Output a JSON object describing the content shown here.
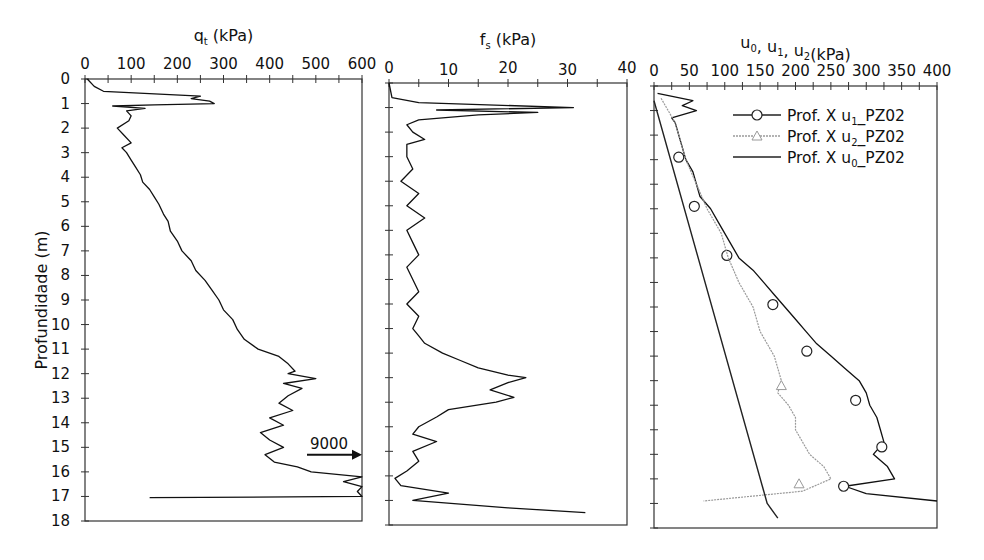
{
  "chart_data": [
    {
      "type": "line",
      "title": "qt (kPa)",
      "title_main": "q",
      "title_sub": "t",
      "title_rest": " (kPa)",
      "xlabel": "qt (kPa)",
      "ylabel": "Profundidade (m)",
      "xlim": [
        0,
        600
      ],
      "ylim": [
        18,
        0
      ],
      "x_ticks": [
        0,
        100,
        200,
        300,
        400,
        500,
        600
      ],
      "y_ticks": [
        0,
        1,
        2,
        3,
        4,
        5,
        6,
        7,
        8,
        9,
        10,
        11,
        12,
        13,
        14,
        15,
        16,
        17,
        18
      ],
      "annotation": {
        "text": "9000",
        "x": 520,
        "depth": 15.3,
        "arrow": "right"
      },
      "series": [
        {
          "name": "qt",
          "depth": [
            0,
            0.3,
            0.5,
            0.7,
            0.8,
            0.9,
            1.0,
            1.05,
            1.1,
            1.2,
            1.3,
            1.5,
            1.7,
            2.0,
            2.3,
            2.6,
            2.8,
            3.0,
            3.3,
            3.6,
            3.9,
            4.2,
            4.5,
            4.8,
            5.1,
            5.5,
            5.8,
            6.2,
            6.6,
            7.0,
            7.4,
            7.8,
            8.2,
            8.6,
            9.0,
            9.4,
            9.8,
            10.2,
            10.6,
            11.0,
            11.3,
            11.6,
            11.9,
            12.0,
            12.2,
            12.4,
            12.6,
            12.9,
            13.2,
            13.5,
            13.8,
            14.1,
            14.4,
            14.7,
            15.0,
            15.3,
            15.6,
            15.8,
            16.0,
            16.2,
            16.4,
            16.6,
            16.8,
            17.0,
            17.05
          ],
          "values": [
            5,
            20,
            40,
            250,
            230,
            270,
            280,
            150,
            60,
            130,
            90,
            100,
            95,
            70,
            85,
            100,
            80,
            90,
            100,
            110,
            120,
            125,
            140,
            150,
            160,
            170,
            180,
            185,
            200,
            210,
            230,
            240,
            260,
            275,
            290,
            300,
            320,
            330,
            345,
            375,
            420,
            440,
            455,
            440,
            500,
            430,
            470,
            440,
            420,
            450,
            400,
            430,
            380,
            400,
            430,
            390,
            410,
            460,
            490,
            600,
            560,
            600,
            590,
            600,
            140
          ]
        }
      ]
    },
    {
      "type": "line",
      "title": "fs (kPa)",
      "title_main": "f",
      "title_sub": "s",
      "title_rest": " (kPa)",
      "xlim": [
        0,
        40
      ],
      "ylim": [
        18,
        0
      ],
      "x_ticks": [
        0,
        10,
        20,
        30,
        40
      ],
      "series": [
        {
          "name": "fs",
          "depth": [
            0,
            0.6,
            0.8,
            1.0,
            1.1,
            1.2,
            1.3,
            1.4,
            1.5,
            1.7,
            2.0,
            2.3,
            2.5,
            3.0,
            3.5,
            4.0,
            4.5,
            5.0,
            5.5,
            6.0,
            6.5,
            7.0,
            7.5,
            8.0,
            8.5,
            9.0,
            9.5,
            10.0,
            10.3,
            10.6,
            11.0,
            11.3,
            11.6,
            11.9,
            12.0,
            12.2,
            12.5,
            12.8,
            13.0,
            13.3,
            13.6,
            14.0,
            14.3,
            14.6,
            15.0,
            15.4,
            15.8,
            16.1,
            16.4,
            16.7,
            17.0,
            17.3,
            17.5
          ],
          "values": [
            0,
            0.5,
            5,
            31,
            8,
            25,
            15,
            10,
            5,
            3,
            4,
            6,
            3,
            3,
            4,
            2,
            5,
            3,
            6,
            3,
            4,
            5,
            3,
            4,
            5,
            3,
            5,
            4,
            5,
            6,
            9,
            12,
            15,
            20,
            23,
            20,
            17,
            21,
            18,
            10,
            8,
            5,
            4,
            8,
            4,
            5,
            3,
            1,
            2,
            10,
            4,
            20,
            33
          ]
        }
      ]
    },
    {
      "type": "line",
      "title": "u0, u1, u2(kPa)",
      "xlim": [
        0,
        400
      ],
      "ylim": [
        18,
        0
      ],
      "x_ticks": [
        0,
        50,
        100,
        150,
        200,
        250,
        300,
        350,
        400
      ],
      "legend": {
        "position": "upper right",
        "entries": [
          {
            "label": "Prof. X u1_PZ02",
            "marker": "circle",
            "style": "solid-dark"
          },
          {
            "label": "Prof. X u2_PZ02",
            "marker": "triangle",
            "style": "dotted-gray"
          },
          {
            "label": "Prof. X u0_PZ02",
            "marker": "none",
            "style": "solid-thin"
          }
        ]
      },
      "series": [
        {
          "name": "Prof. X u1_PZ02",
          "depth": [
            0.3,
            0.6,
            0.8,
            1.0,
            1.3,
            1.5,
            2.0,
            2.5,
            3.0,
            3.5,
            4.0,
            4.5,
            5.0,
            5.5,
            6.0,
            6.5,
            7.0,
            7.5,
            8.0,
            8.5,
            9.0,
            9.5,
            10.0,
            10.5,
            11.0,
            11.5,
            12.0,
            12.5,
            13.0,
            13.5,
            14.0,
            14.5,
            15.0,
            15.5,
            16.0,
            16.3,
            16.6,
            16.9
          ],
          "values": [
            5,
            55,
            40,
            60,
            25,
            30,
            35,
            40,
            45,
            55,
            60,
            65,
            80,
            90,
            100,
            110,
            120,
            140,
            155,
            170,
            185,
            200,
            215,
            230,
            250,
            270,
            290,
            300,
            305,
            315,
            320,
            325,
            310,
            330,
            340,
            270,
            300,
            400
          ],
          "marker_points": {
            "depth": [
              2.9,
              4.9,
              6.9,
              8.9,
              10.8,
              12.8,
              14.7,
              16.3
            ],
            "values": [
              35,
              57,
              103,
              168,
              216,
              285,
              322,
              268
            ]
          }
        },
        {
          "name": "Prof. X u2_PZ02",
          "depth": [
            0.5,
            1.0,
            1.5,
            2.0,
            3.0,
            4.0,
            5.0,
            6.0,
            7.0,
            8.0,
            9.0,
            10.0,
            11.0,
            12.0,
            12.5,
            13.0,
            13.5,
            14.0,
            14.5,
            15.0,
            15.5,
            16.0,
            16.5,
            16.9
          ],
          "values": [
            10,
            20,
            30,
            35,
            45,
            60,
            75,
            95,
            105,
            120,
            140,
            150,
            170,
            180,
            175,
            190,
            200,
            200,
            210,
            220,
            240,
            250,
            210,
            70
          ],
          "marker_points": {
            "depth": [
              12.2,
              16.2
            ],
            "values": [
              180,
              205
            ]
          }
        },
        {
          "name": "Prof. X u0_PZ02",
          "depth": [
            0.6,
            17.0,
            17.6
          ],
          "values": [
            0,
            160,
            175
          ]
        }
      ]
    }
  ]
}
